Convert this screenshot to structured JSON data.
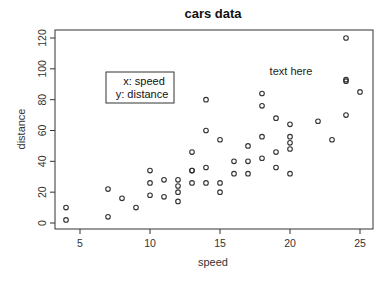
{
  "chart_data": {
    "type": "scatter",
    "title": "cars data",
    "xlabel": "speed",
    "ylabel": "distance",
    "xlim": [
      3.4,
      25.6
    ],
    "ylim": [
      -4.4,
      124.4
    ],
    "xticks": [
      5,
      10,
      15,
      20,
      25
    ],
    "yticks": [
      0,
      20,
      40,
      60,
      80,
      100,
      120
    ],
    "grid": false,
    "marker": "open-circle",
    "legend": {
      "position": "inset-left-upper",
      "lines": [
        "x: speed",
        "y: distance"
      ]
    },
    "annotations": [
      {
        "text": "text here",
        "x": 19.7,
        "y": 98
      }
    ],
    "points": [
      {
        "x": 4,
        "y": 2
      },
      {
        "x": 4,
        "y": 10
      },
      {
        "x": 7,
        "y": 4
      },
      {
        "x": 7,
        "y": 22
      },
      {
        "x": 8,
        "y": 16
      },
      {
        "x": 9,
        "y": 10
      },
      {
        "x": 10,
        "y": 18
      },
      {
        "x": 10,
        "y": 26
      },
      {
        "x": 10,
        "y": 34
      },
      {
        "x": 11,
        "y": 17
      },
      {
        "x": 11,
        "y": 28
      },
      {
        "x": 12,
        "y": 14
      },
      {
        "x": 12,
        "y": 20
      },
      {
        "x": 12,
        "y": 24
      },
      {
        "x": 12,
        "y": 28
      },
      {
        "x": 13,
        "y": 26
      },
      {
        "x": 13,
        "y": 34
      },
      {
        "x": 13,
        "y": 34
      },
      {
        "x": 13,
        "y": 46
      },
      {
        "x": 14,
        "y": 26
      },
      {
        "x": 14,
        "y": 36
      },
      {
        "x": 14,
        "y": 60
      },
      {
        "x": 14,
        "y": 80
      },
      {
        "x": 15,
        "y": 20
      },
      {
        "x": 15,
        "y": 26
      },
      {
        "x": 15,
        "y": 54
      },
      {
        "x": 16,
        "y": 32
      },
      {
        "x": 16,
        "y": 40
      },
      {
        "x": 17,
        "y": 32
      },
      {
        "x": 17,
        "y": 40
      },
      {
        "x": 17,
        "y": 50
      },
      {
        "x": 18,
        "y": 42
      },
      {
        "x": 18,
        "y": 56
      },
      {
        "x": 18,
        "y": 76
      },
      {
        "x": 18,
        "y": 84
      },
      {
        "x": 19,
        "y": 36
      },
      {
        "x": 19,
        "y": 46
      },
      {
        "x": 19,
        "y": 68
      },
      {
        "x": 20,
        "y": 32
      },
      {
        "x": 20,
        "y": 48
      },
      {
        "x": 20,
        "y": 52
      },
      {
        "x": 20,
        "y": 56
      },
      {
        "x": 20,
        "y": 64
      },
      {
        "x": 22,
        "y": 66
      },
      {
        "x": 23,
        "y": 54
      },
      {
        "x": 24,
        "y": 70
      },
      {
        "x": 24,
        "y": 92
      },
      {
        "x": 24,
        "y": 93
      },
      {
        "x": 24,
        "y": 120
      },
      {
        "x": 25,
        "y": 85
      }
    ]
  }
}
